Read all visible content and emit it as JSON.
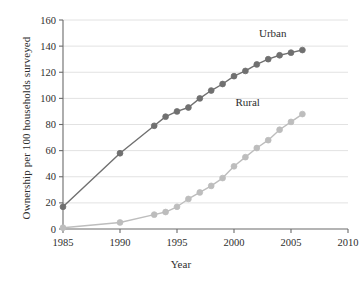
{
  "chart_data": {
    "type": "line",
    "title": "",
    "subtitle": "",
    "xlabel": "Year",
    "ylabel": "Ownership per 100 households surveyed",
    "xlim": [
      1985,
      2010
    ],
    "ylim": [
      0,
      160
    ],
    "xticks": [
      1985,
      1990,
      1995,
      2000,
      2005,
      2010
    ],
    "yticks": [
      0,
      20,
      40,
      60,
      80,
      100,
      120,
      140,
      160
    ],
    "grid": "horizontal",
    "legend_position": "inline-annotations",
    "series": [
      {
        "name": "Urban",
        "color": "#707070",
        "marker": "circle",
        "annotation": "Urban",
        "annotation_x": 2003.4,
        "annotation_y": 147,
        "points": [
          {
            "x": 1985,
            "y": 17
          },
          {
            "x": 1990,
            "y": 58
          },
          {
            "x": 1993,
            "y": 79
          },
          {
            "x": 1994,
            "y": 86
          },
          {
            "x": 1995,
            "y": 90
          },
          {
            "x": 1996,
            "y": 93
          },
          {
            "x": 1997,
            "y": 100
          },
          {
            "x": 1998,
            "y": 106
          },
          {
            "x": 1999,
            "y": 111
          },
          {
            "x": 2000,
            "y": 117
          },
          {
            "x": 2001,
            "y": 121
          },
          {
            "x": 2002,
            "y": 126
          },
          {
            "x": 2003,
            "y": 130
          },
          {
            "x": 2004,
            "y": 133
          },
          {
            "x": 2005,
            "y": 135
          },
          {
            "x": 2006,
            "y": 137
          }
        ]
      },
      {
        "name": "Rural",
        "color": "#bdbdbd",
        "marker": "circle",
        "annotation": "Rural",
        "annotation_x": 2001.2,
        "annotation_y": 94,
        "points": [
          {
            "x": 1985,
            "y": 1
          },
          {
            "x": 1990,
            "y": 5
          },
          {
            "x": 1993,
            "y": 11
          },
          {
            "x": 1994,
            "y": 13
          },
          {
            "x": 1995,
            "y": 17
          },
          {
            "x": 1996,
            "y": 23
          },
          {
            "x": 1997,
            "y": 28
          },
          {
            "x": 1998,
            "y": 33
          },
          {
            "x": 1999,
            "y": 39
          },
          {
            "x": 2000,
            "y": 48
          },
          {
            "x": 2001,
            "y": 55
          },
          {
            "x": 2002,
            "y": 62
          },
          {
            "x": 2003,
            "y": 68
          },
          {
            "x": 2004,
            "y": 76
          },
          {
            "x": 2005,
            "y": 82
          },
          {
            "x": 2006,
            "y": 88
          }
        ]
      }
    ]
  },
  "axes": {
    "x_tick_labels": [
      "1985",
      "1990",
      "1995",
      "2000",
      "2005",
      "2010"
    ],
    "y_tick_labels": [
      "0",
      "20",
      "40",
      "60",
      "80",
      "100",
      "120",
      "140",
      "160"
    ],
    "x_title": "Year",
    "y_title": "Ownership per 100 households surveyed"
  },
  "colors": {
    "urban": "#707070",
    "rural": "#bdbdbd",
    "axis": "#6b6b6b",
    "grid": "#e2e2e2",
    "text": "#2e2e2e",
    "background": "#ffffff"
  }
}
